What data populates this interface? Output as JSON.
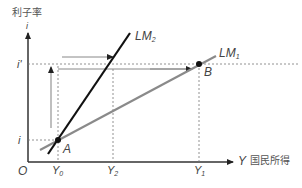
{
  "axes": {
    "y_label": "利子率",
    "y_symbol": "i",
    "x_symbol": "Y",
    "x_label": "国民所得",
    "origin": "O"
  },
  "ticks": {
    "y": [
      {
        "label": "i'",
        "level": "high"
      },
      {
        "label": "i",
        "level": "low"
      }
    ],
    "x": [
      {
        "label": "Y",
        "sub": "0"
      },
      {
        "label": "Y",
        "sub": "2"
      },
      {
        "label": "Y",
        "sub": "1"
      }
    ]
  },
  "curves": [
    {
      "name": "LM",
      "sub": "2",
      "color": "#111111"
    },
    {
      "name": "LM",
      "sub": "1",
      "color": "#888888"
    }
  ],
  "points": [
    {
      "label": "A",
      "x_tick": "Y0",
      "y_tick": "i"
    },
    {
      "label": "B",
      "x_tick": "Y1",
      "y_tick": "i'"
    }
  ],
  "colors": {
    "axis": "#222222",
    "lm2": "#111111",
    "lm1": "#8a8a8a",
    "guide": "#777777"
  }
}
